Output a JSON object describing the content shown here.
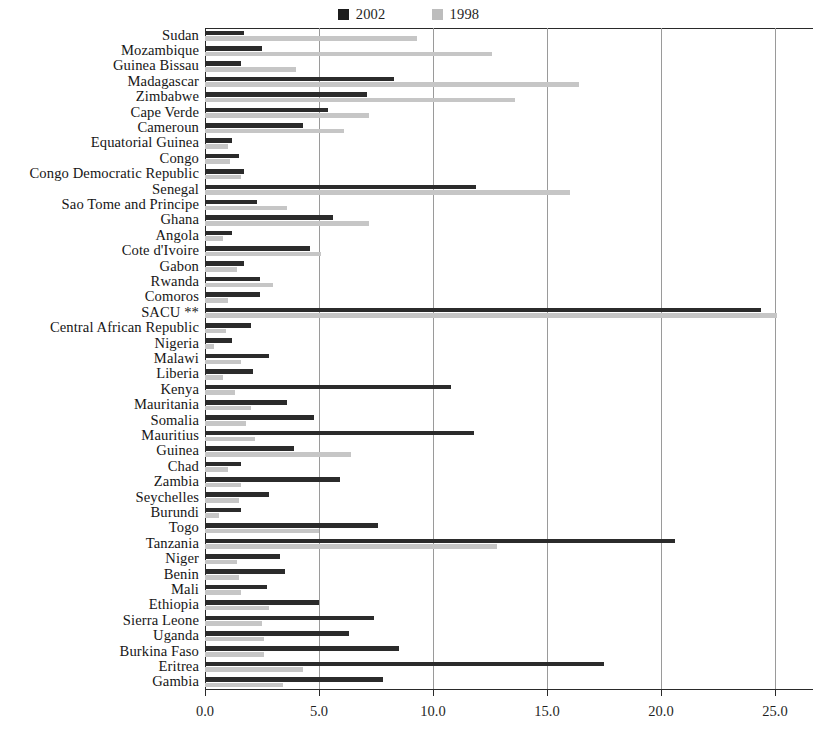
{
  "legend": {
    "entries": [
      {
        "label": "2002",
        "color": "#1c1c1c",
        "key": "v2002"
      },
      {
        "label": "1998",
        "color": "#bdbdbd",
        "key": "v1998"
      }
    ]
  },
  "axis": {
    "tick_labels": [
      "0.0",
      "5.0",
      "10.0",
      "15.0",
      "20.0",
      "25.0"
    ],
    "ticks": [
      0,
      5,
      10,
      15,
      20,
      25
    ],
    "min": 0,
    "max": 25.8
  },
  "chart_data": {
    "type": "bar",
    "orientation": "horizontal",
    "title": "",
    "subtitle": "",
    "xlabel": "",
    "ylabel": "",
    "xlim": [
      0,
      25.8
    ],
    "grid": "vertical",
    "legend_position": "top-center",
    "categories": [
      "Sudan",
      "Mozambique",
      "Guinea Bissau",
      "Madagascar",
      "Zimbabwe",
      "Cape Verde",
      "Cameroun",
      "Equatorial Guinea",
      "Congo",
      "Congo Democratic Republic",
      "Senegal",
      "Sao Tome and Principe",
      "Ghana",
      "Angola",
      "Cote d'Ivoire",
      "Gabon",
      "Rwanda",
      "Comoros",
      "SACU **",
      "Central African Republic",
      "Nigeria",
      "Malawi",
      "Liberia",
      "Kenya",
      "Mauritania",
      "Somalia",
      "Mauritius",
      "Guinea",
      "Chad",
      "Zambia",
      "Seychelles",
      "Burundi",
      "Togo",
      "Tanzania",
      "Niger",
      "Benin",
      "Mali",
      "Ethiopia",
      "Sierra Leone",
      "Uganda",
      "Burkina Faso",
      "Eritrea",
      "Gambia"
    ],
    "series": [
      {
        "name": "2002",
        "color": "#2b2b2b",
        "values": [
          1.7,
          2.5,
          1.6,
          8.3,
          7.1,
          5.4,
          4.3,
          1.2,
          1.5,
          1.7,
          11.9,
          2.3,
          5.6,
          1.2,
          4.6,
          1.7,
          2.4,
          2.4,
          24.4,
          2.0,
          1.2,
          2.8,
          2.1,
          10.8,
          3.6,
          4.8,
          11.8,
          3.9,
          1.6,
          5.9,
          2.8,
          1.6,
          7.6,
          20.6,
          3.3,
          3.5,
          2.7,
          5.0,
          7.4,
          6.3,
          8.5,
          17.5,
          7.8
        ]
      },
      {
        "name": "1998",
        "color": "#c6c6c6",
        "values": [
          9.3,
          12.6,
          4.0,
          16.4,
          13.6,
          7.2,
          6.1,
          1.0,
          1.1,
          1.6,
          16.0,
          3.6,
          7.2,
          0.8,
          5.1,
          1.4,
          3.0,
          1.0,
          25.1,
          0.9,
          0.4,
          1.6,
          0.8,
          1.3,
          2.0,
          1.8,
          2.2,
          6.4,
          1.0,
          1.6,
          1.5,
          0.6,
          5.0,
          12.8,
          1.4,
          1.5,
          1.6,
          2.8,
          2.5,
          2.6,
          2.6,
          4.3,
          3.4
        ]
      }
    ]
  }
}
